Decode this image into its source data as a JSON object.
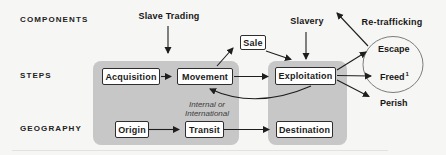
{
  "diagram": {
    "row_labels": {
      "components": "COMPONENTS",
      "steps": "STEPS",
      "geography": "GEOGRAPHY"
    },
    "top_labels": {
      "slave_trading": "Slave Trading",
      "slavery": "Slavery",
      "re_trafficking": "Re-trafficking"
    },
    "steps": {
      "acquisition": "Acquisition",
      "movement": "Movement",
      "sale": "Sale",
      "exploitation": "Exploitation"
    },
    "geography": {
      "origin": "Origin",
      "transit": "Transit",
      "destination": "Destination"
    },
    "movement_note": {
      "line1": "Internal or",
      "line2": "International"
    },
    "outcomes": {
      "escape": "Escape",
      "freed": "Freed",
      "freed_footnote": "1",
      "perish": "Perish"
    },
    "colors": {
      "background": "#f6f6f4",
      "block_gray": "#c7c7c7",
      "box_border": "#2e2e2e",
      "arrow": "#1e1e1e",
      "circle_border": "#7c7c7c"
    }
  }
}
